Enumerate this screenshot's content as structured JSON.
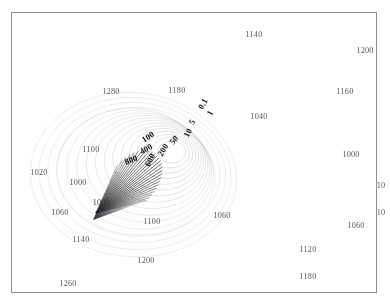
{
  "figure": {
    "background_color": "#ffffff",
    "frame_color": "#8e8e8e",
    "width": 390,
    "height": 307
  },
  "chart_data": {
    "type": "line",
    "title": "",
    "subtitle": "",
    "xlabel": "",
    "ylabel": "",
    "grid": false,
    "legend_position": "none",
    "contour_levels": [
      0.1,
      1,
      5,
      10,
      50,
      100,
      200,
      400,
      600,
      800
    ],
    "contour_level_labels": [
      "0.1",
      "1",
      "5",
      "10",
      "50",
      "100",
      "200",
      "400",
      "600",
      "800"
    ],
    "grid_annotation_values": [
      1140,
      1200,
      1280,
      1180,
      1160,
      1040,
      1100,
      1000,
      1020,
      1000,
      1060,
      10,
      10,
      1100,
      1060,
      1060,
      1140,
      1120,
      1200,
      1180,
      1260,
      1000
    ],
    "ray_fan": {
      "apex_x": 96,
      "apex_y": 213,
      "ray_count": 26,
      "angle_start_deg": -66,
      "angle_end_deg": -14,
      "color": "#1d1d1d"
    },
    "contour_color": "#d5d5d9",
    "contour_center_x": 172,
    "contour_center_y": 152
  },
  "contour_labels": [
    {
      "text": "0.1",
      "x": 203,
      "y": 104,
      "rotate": -62
    },
    {
      "text": "1",
      "x": 210,
      "y": 113,
      "rotate": -62
    },
    {
      "text": "5",
      "x": 192,
      "y": 122,
      "rotate": -62
    },
    {
      "text": "10",
      "x": 188,
      "y": 133,
      "rotate": -62
    },
    {
      "text": "50",
      "x": 174,
      "y": 140,
      "rotate": -50
    },
    {
      "text": "100",
      "x": 148,
      "y": 137,
      "rotate": -33
    },
    {
      "text": "200",
      "x": 163,
      "y": 150,
      "rotate": -58
    },
    {
      "text": "400",
      "x": 146,
      "y": 149,
      "rotate": -30
    },
    {
      "text": "600",
      "x": 150,
      "y": 160,
      "rotate": -62
    },
    {
      "text": "800",
      "x": 131,
      "y": 160,
      "rotate": -22
    }
  ],
  "grid_labels": [
    {
      "text": "1140",
      "x": 254,
      "y": 35
    },
    {
      "text": "1200",
      "x": 365,
      "y": 51
    },
    {
      "text": "1280",
      "x": 111,
      "y": 92
    },
    {
      "text": "1180",
      "x": 177,
      "y": 91
    },
    {
      "text": "1160",
      "x": 345,
      "y": 92
    },
    {
      "text": "1040",
      "x": 259,
      "y": 117
    },
    {
      "text": "1100",
      "x": 91,
      "y": 150
    },
    {
      "text": "1000",
      "x": 351,
      "y": 155
    },
    {
      "text": "1020",
      "x": 39,
      "y": 173
    },
    {
      "text": "1000",
      "x": 78,
      "y": 183
    },
    {
      "text": "10",
      "x": 381,
      "y": 186
    },
    {
      "text": "1060",
      "x": 60,
      "y": 213
    },
    {
      "text": "10",
      "x": 381,
      "y": 213
    },
    {
      "text": "1060",
      "x": 222,
      "y": 216
    },
    {
      "text": "1060",
      "x": 356,
      "y": 226
    },
    {
      "text": "1100",
      "x": 152,
      "y": 222
    },
    {
      "text": "1140",
      "x": 81,
      "y": 240
    },
    {
      "text": "1120",
      "x": 308,
      "y": 250
    },
    {
      "text": "1200",
      "x": 146,
      "y": 261
    },
    {
      "text": "1180",
      "x": 308,
      "y": 277
    },
    {
      "text": "1260",
      "x": 68,
      "y": 284
    }
  ],
  "apex_label": {
    "text": "1000",
    "x": 101,
    "y": 203
  }
}
